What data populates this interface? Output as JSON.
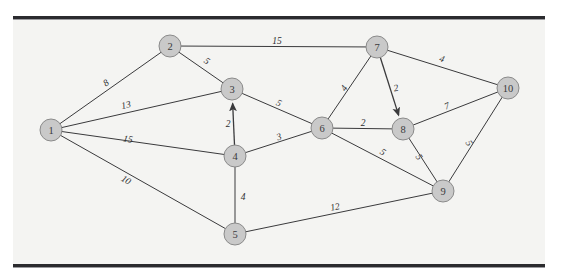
{
  "figure": {
    "background_color": "#f4f4f2",
    "page_color": "#ffffff",
    "rule_color": "#2b2b2e",
    "node_fill": "#c9c9c9",
    "node_stroke": "#8a8a8a",
    "edge_color": "#3a3a3c",
    "label_color": "#3a3a3c"
  },
  "chart_data": {
    "type": "diagram",
    "subtype": "weighted-graph",
    "title": "",
    "directed_edges_present": true,
    "nodes": [
      {
        "id": "1",
        "label": "1",
        "x": 51,
        "y": 130
      },
      {
        "id": "2",
        "label": "2",
        "x": 170,
        "y": 46
      },
      {
        "id": "3",
        "label": "3",
        "x": 232,
        "y": 89
      },
      {
        "id": "4",
        "label": "4",
        "x": 235,
        "y": 156
      },
      {
        "id": "5",
        "label": "5",
        "x": 235,
        "y": 234
      },
      {
        "id": "6",
        "label": "6",
        "x": 322,
        "y": 128
      },
      {
        "id": "7",
        "label": "7",
        "x": 377,
        "y": 47
      },
      {
        "id": "8",
        "label": "8",
        "x": 403,
        "y": 129
      },
      {
        "id": "9",
        "label": "9",
        "x": 443,
        "y": 191
      },
      {
        "id": "10",
        "label": "10",
        "x": 508,
        "y": 88
      }
    ],
    "edges": [
      {
        "from": "1",
        "to": "2",
        "weight": 8,
        "directed": false,
        "label_x": 106,
        "label_y": 83,
        "label_rotate": -35
      },
      {
        "from": "1",
        "to": "3",
        "weight": 13,
        "directed": false,
        "label_x": 126,
        "label_y": 105,
        "label_rotate": -13
      },
      {
        "from": "1",
        "to": "4",
        "weight": 15,
        "directed": false,
        "label_x": 128,
        "label_y": 139,
        "label_rotate": 10
      },
      {
        "from": "1",
        "to": "5",
        "weight": 10,
        "directed": false,
        "label_x": 126,
        "label_y": 180,
        "label_rotate": 31
      },
      {
        "from": "2",
        "to": "7",
        "weight": 15,
        "directed": false,
        "label_x": 277,
        "label_y": 41,
        "label_rotate": 0
      },
      {
        "from": "2",
        "to": "3",
        "weight": 5,
        "directed": false,
        "label_x": 207,
        "label_y": 61,
        "label_rotate": 35
      },
      {
        "from": "4",
        "to": "3",
        "weight": 2,
        "directed": true,
        "label_x": 228,
        "label_y": 124,
        "label_rotate": 0
      },
      {
        "from": "3",
        "to": "6",
        "weight": 5,
        "directed": false,
        "label_x": 279,
        "label_y": 103,
        "label_rotate": 25
      },
      {
        "from": "4",
        "to": "6",
        "weight": 3,
        "directed": false,
        "label_x": 279,
        "label_y": 137,
        "label_rotate": -19
      },
      {
        "from": "4",
        "to": "5",
        "weight": 4,
        "directed": false,
        "label_x": 243,
        "label_y": 197,
        "label_rotate": 0
      },
      {
        "from": "5",
        "to": "9",
        "weight": 12,
        "directed": false,
        "label_x": 335,
        "label_y": 207,
        "label_rotate": -11
      },
      {
        "from": "6",
        "to": "7",
        "weight": 4,
        "directed": false,
        "label_x": 344,
        "label_y": 88,
        "label_rotate": -57
      },
      {
        "from": "7",
        "to": "8",
        "weight": 2,
        "directed": true,
        "label_x": 396,
        "label_y": 88,
        "label_rotate": -12
      },
      {
        "from": "6",
        "to": "8",
        "weight": 2,
        "directed": false,
        "label_x": 363,
        "label_y": 123,
        "label_rotate": 0
      },
      {
        "from": "6",
        "to": "9",
        "weight": 5,
        "directed": false,
        "label_x": 383,
        "label_y": 152,
        "label_rotate": 33
      },
      {
        "from": "8",
        "to": "9",
        "weight": 5,
        "directed": false,
        "label_x": 419,
        "label_y": 157,
        "label_rotate": 56
      },
      {
        "from": "7",
        "to": "10",
        "weight": 4,
        "directed": false,
        "label_x": 442,
        "label_y": 59,
        "label_rotate": 18
      },
      {
        "from": "8",
        "to": "10",
        "weight": 7,
        "directed": false,
        "label_x": 447,
        "label_y": 106,
        "label_rotate": -21
      },
      {
        "from": "9",
        "to": "10",
        "weight": 5,
        "directed": false,
        "label_x": 469,
        "label_y": 143,
        "label_rotate": 57
      }
    ]
  }
}
